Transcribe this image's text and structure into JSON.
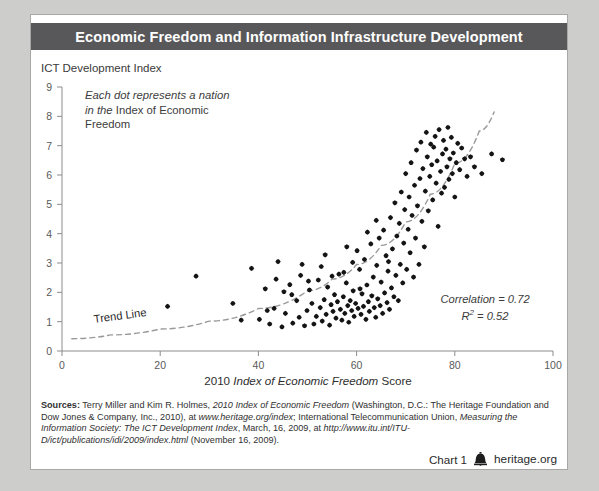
{
  "header": {
    "title": "Economic Freedom and Information Infrastructure Development"
  },
  "annotations": {
    "dots_note_italic_1": "Each dot represents a",
    "dots_note_italic_2": "nation in the ",
    "dots_note_roman_2": "Index of",
    "dots_note_roman_3": "Economic Freedom",
    "trend_label": "Trend Line",
    "correlation": "Correlation = 0.72",
    "r_squared_prefix": "R",
    "r_squared_sup": "2",
    "r_squared_value": " = 0.52"
  },
  "sources": {
    "label": "Sources:",
    "text_1": " Terry Miller and Kim R. Holmes, ",
    "italic_1": "2010 Index of Economic Freedom",
    "text_2": " (Washington, D.C.: The Heritage Foundation and Dow Jones & Company, Inc., 2010), at ",
    "italic_2": "www.heritage.org/index",
    "text_3": "; International Telecommunication Union, ",
    "italic_3": "Measuring the Information Society: The ICT Development Index",
    "text_4": ", March, 16, 2009, at ",
    "italic_4": "http://www.itu.int/ITU-D/ict/publications/idi/2009/index.html",
    "text_5": " (November 16, 2009)."
  },
  "footer": {
    "chart_number": "Chart 1",
    "logo_name": "liberty-bell-icon",
    "site": "heritage.org"
  },
  "chart_data": {
    "type": "scatter",
    "title": "Economic Freedom and Information Infrastructure Development",
    "xlabel": "2010 Index of Economic Freedom Score",
    "ylabel": "ICT Development Index",
    "xlim": [
      0,
      100
    ],
    "ylim": [
      0,
      9
    ],
    "xticks": [
      0,
      20,
      40,
      60,
      80,
      100
    ],
    "yticks": [
      0,
      1,
      2,
      3,
      4,
      5,
      6,
      7,
      8,
      9
    ],
    "grid": false,
    "legend": null,
    "correlation": 0.72,
    "r_squared": 0.52,
    "marker_color": "#141414",
    "trendline": {
      "style": "dashed",
      "color": "#9a9a9a",
      "label": "Trend Line",
      "type": "exponential",
      "points": [
        [
          2,
          0.42
        ],
        [
          10,
          0.55
        ],
        [
          20,
          0.75
        ],
        [
          30,
          1.02
        ],
        [
          40,
          1.45
        ],
        [
          50,
          2.05
        ],
        [
          55,
          2.45
        ],
        [
          60,
          2.95
        ],
        [
          65,
          3.6
        ],
        [
          70,
          4.4
        ],
        [
          75,
          5.35
        ],
        [
          80,
          6.4
        ],
        [
          85,
          7.5
        ],
        [
          88,
          8.15
        ]
      ]
    },
    "points": [
      [
        21.5,
        1.52
      ],
      [
        27.3,
        2.55
      ],
      [
        34.8,
        1.62
      ],
      [
        36.5,
        1.05
      ],
      [
        38.6,
        2.82
      ],
      [
        40.2,
        1.08
      ],
      [
        41.4,
        2.12
      ],
      [
        42.3,
        0.92
      ],
      [
        43.2,
        1.45
      ],
      [
        44.0,
        3.05
      ],
      [
        44.8,
        0.82
      ],
      [
        45.5,
        1.28
      ],
      [
        46.4,
        2.26
      ],
      [
        47.0,
        0.95
      ],
      [
        47.8,
        1.72
      ],
      [
        48.3,
        1.15
      ],
      [
        48.9,
        2.95
      ],
      [
        49.4,
        0.86
      ],
      [
        49.9,
        1.38
      ],
      [
        50.4,
        2.08
      ],
      [
        50.9,
        1.62
      ],
      [
        51.3,
        0.92
      ],
      [
        51.8,
        1.18
      ],
      [
        52.2,
        2.42
      ],
      [
        52.6,
        1.48
      ],
      [
        53.0,
        1.02
      ],
      [
        53.4,
        1.75
      ],
      [
        53.8,
        1.25
      ],
      [
        54.1,
        2.18
      ],
      [
        54.5,
        0.88
      ],
      [
        54.8,
        1.58
      ],
      [
        55.2,
        1.35
      ],
      [
        55.5,
        1.92
      ],
      [
        55.8,
        1.12
      ],
      [
        56.1,
        1.68
      ],
      [
        56.4,
        2.62
      ],
      [
        56.7,
        1.42
      ],
      [
        57.0,
        1.05
      ],
      [
        57.3,
        1.85
      ],
      [
        57.6,
        1.28
      ],
      [
        57.9,
        2.32
      ],
      [
        58.2,
        1.55
      ],
      [
        58.4,
        0.98
      ],
      [
        58.7,
        1.72
      ],
      [
        59.0,
        1.38
      ],
      [
        59.3,
        2.05
      ],
      [
        59.5,
        1.18
      ],
      [
        59.8,
        1.62
      ],
      [
        60.1,
        3.42
      ],
      [
        60.3,
        1.45
      ],
      [
        60.6,
        2.78
      ],
      [
        60.9,
        1.25
      ],
      [
        61.1,
        1.95
      ],
      [
        61.4,
        1.52
      ],
      [
        61.6,
        3.12
      ],
      [
        61.9,
        1.08
      ],
      [
        62.1,
        2.25
      ],
      [
        62.4,
        1.68
      ],
      [
        62.6,
        1.35
      ],
      [
        62.9,
        3.65
      ],
      [
        63.1,
        1.88
      ],
      [
        63.4,
        2.52
      ],
      [
        63.6,
        1.48
      ],
      [
        63.9,
        1.15
      ],
      [
        64.1,
        2.92
      ],
      [
        64.3,
        1.78
      ],
      [
        64.6,
        3.85
      ],
      [
        64.8,
        1.55
      ],
      [
        65.0,
        2.35
      ],
      [
        65.3,
        1.28
      ],
      [
        65.5,
        4.12
      ],
      [
        65.7,
        1.98
      ],
      [
        66.0,
        3.25
      ],
      [
        66.2,
        1.65
      ],
      [
        66.4,
        2.72
      ],
      [
        66.7,
        1.42
      ],
      [
        66.9,
        4.55
      ],
      [
        67.1,
        2.15
      ],
      [
        67.3,
        3.48
      ],
      [
        67.6,
        1.85
      ],
      [
        67.8,
        5.05
      ],
      [
        68.0,
        2.58
      ],
      [
        68.2,
        3.92
      ],
      [
        68.5,
        1.72
      ],
      [
        68.7,
        4.35
      ],
      [
        68.9,
        2.95
      ],
      [
        69.1,
        5.42
      ],
      [
        69.4,
        2.32
      ],
      [
        69.6,
        3.68
      ],
      [
        69.8,
        4.82
      ],
      [
        70.0,
        6.05
      ],
      [
        70.2,
        2.78
      ],
      [
        70.5,
        4.15
      ],
      [
        70.7,
        5.25
      ],
      [
        70.9,
        3.35
      ],
      [
        71.1,
        6.42
      ],
      [
        71.3,
        4.62
      ],
      [
        71.6,
        2.52
      ],
      [
        71.8,
        5.65
      ],
      [
        72.0,
        3.85
      ],
      [
        72.2,
        6.85
      ],
      [
        72.4,
        4.95
      ],
      [
        72.7,
        2.95
      ],
      [
        72.9,
        5.88
      ],
      [
        73.1,
        7.12
      ],
      [
        73.3,
        4.42
      ],
      [
        73.5,
        6.22
      ],
      [
        73.8,
        3.55
      ],
      [
        74.0,
        5.45
      ],
      [
        74.2,
        7.45
      ],
      [
        74.4,
        6.62
      ],
      [
        74.6,
        4.78
      ],
      [
        74.9,
        5.95
      ],
      [
        75.1,
        7.05
      ],
      [
        75.3,
        6.35
      ],
      [
        75.5,
        5.15
      ],
      [
        75.7,
        6.95
      ],
      [
        76.0,
        7.32
      ],
      [
        76.2,
        5.72
      ],
      [
        76.4,
        6.48
      ],
      [
        76.6,
        4.25
      ],
      [
        76.8,
        7.55
      ],
      [
        77.1,
        6.12
      ],
      [
        77.3,
        5.38
      ],
      [
        77.5,
        6.72
      ],
      [
        77.7,
        7.18
      ],
      [
        77.9,
        5.58
      ],
      [
        78.2,
        6.88
      ],
      [
        78.4,
        6.28
      ],
      [
        78.6,
        7.62
      ],
      [
        78.8,
        5.85
      ],
      [
        79.0,
        6.55
      ],
      [
        79.3,
        7.28
      ],
      [
        79.5,
        6.05
      ],
      [
        79.7,
        6.75
      ],
      [
        80.0,
        5.25
      ],
      [
        80.3,
        6.42
      ],
      [
        80.6,
        7.08
      ],
      [
        81.0,
        6.18
      ],
      [
        81.4,
        6.92
      ],
      [
        82.0,
        6.55
      ],
      [
        82.5,
        5.95
      ],
      [
        83.2,
        6.62
      ],
      [
        84.0,
        6.28
      ],
      [
        85.5,
        6.05
      ],
      [
        87.5,
        6.72
      ],
      [
        89.7,
        6.52
      ],
      [
        59.2,
        3.02
      ],
      [
        57.4,
        2.68
      ],
      [
        55.0,
        2.55
      ],
      [
        52.8,
        2.88
      ],
      [
        50.2,
        2.38
      ],
      [
        46.8,
        1.92
      ],
      [
        43.6,
        2.45
      ],
      [
        41.8,
        1.38
      ],
      [
        62.2,
        4.05
      ],
      [
        64.0,
        4.45
      ],
      [
        66.5,
        3.05
      ],
      [
        60.7,
        2.12
      ],
      [
        53.6,
        3.28
      ],
      [
        48.6,
        2.58
      ],
      [
        45.2,
        2.02
      ],
      [
        58.0,
        3.55
      ]
    ]
  }
}
